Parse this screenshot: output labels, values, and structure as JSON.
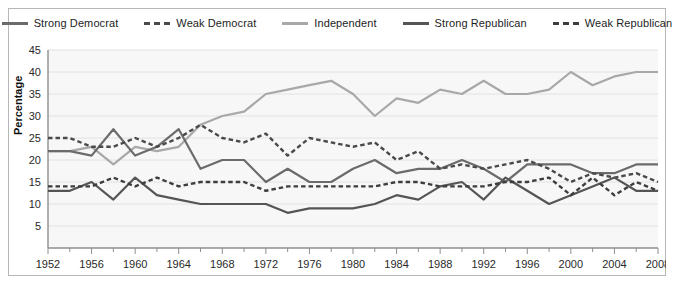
{
  "chart_data": {
    "type": "line",
    "title": "",
    "xlabel": "",
    "ylabel": "Percentage",
    "xlim": [
      1952,
      2008
    ],
    "ylim": [
      0,
      45
    ],
    "ytick_step": 5,
    "yticks": [
      5,
      10,
      15,
      20,
      25,
      30,
      35,
      40,
      45
    ],
    "xticks": [
      1952,
      1956,
      1960,
      1964,
      1968,
      1972,
      1976,
      1980,
      1984,
      1988,
      1992,
      1996,
      2000,
      2004,
      2008
    ],
    "x_minor_step": 2,
    "grid": "horizontal",
    "legend_position": "top-center",
    "x": [
      1952,
      1954,
      1956,
      1958,
      1960,
      1962,
      1964,
      1966,
      1968,
      1970,
      1972,
      1974,
      1976,
      1978,
      1980,
      1982,
      1984,
      1986,
      1988,
      1990,
      1992,
      1994,
      1996,
      1998,
      2000,
      2002,
      2004,
      2006,
      2008
    ],
    "series": [
      {
        "name": "Strong Democrat",
        "style": "solid",
        "color": "#6b6b6b",
        "values": [
          22,
          22,
          21,
          27,
          21,
          23,
          27,
          18,
          20,
          20,
          15,
          18,
          15,
          15,
          18,
          20,
          17,
          18,
          18,
          20,
          18,
          15,
          19,
          19,
          19,
          17,
          17,
          19,
          19
        ]
      },
      {
        "name": "Weak Democrat",
        "style": "dashed",
        "color": "#4a4a4a",
        "values": [
          25,
          25,
          23,
          23,
          25,
          23,
          25,
          28,
          25,
          24,
          26,
          21,
          25,
          24,
          23,
          24,
          20,
          22,
          18,
          19,
          18,
          19,
          20,
          18,
          15,
          17,
          16,
          17,
          15
        ]
      },
      {
        "name": "Independent",
        "style": "solid",
        "color": "#a8a8a8",
        "values": [
          22,
          22,
          23,
          19,
          23,
          22,
          23,
          28,
          30,
          31,
          35,
          36,
          37,
          38,
          35,
          30,
          34,
          33,
          36,
          35,
          38,
          35,
          35,
          36,
          40,
          37,
          39,
          40,
          40
        ]
      },
      {
        "name": "Strong Republican",
        "style": "solid",
        "color": "#555555",
        "values": [
          13,
          13,
          15,
          11,
          16,
          12,
          11,
          10,
          10,
          10,
          10,
          8,
          9,
          9,
          9,
          10,
          12,
          11,
          14,
          15,
          11,
          16,
          13,
          10,
          12,
          14,
          16,
          13,
          13
        ]
      },
      {
        "name": "Weak Republican",
        "style": "dashed",
        "color": "#3d3d3d",
        "values": [
          14,
          14,
          14,
          16,
          14,
          16,
          14,
          15,
          15,
          15,
          13,
          14,
          14,
          14,
          14,
          14,
          15,
          15,
          14,
          14,
          14,
          15,
          15,
          16,
          12,
          16,
          12,
          15,
          13
        ]
      }
    ]
  },
  "legend": {
    "items": [
      {
        "label": "Strong Democrat",
        "style": "solid",
        "color": "#6b6b6b"
      },
      {
        "label": "Weak Democrat",
        "style": "dashed",
        "color": "#4a4a4a"
      },
      {
        "label": "Independent",
        "style": "solid",
        "color": "#a8a8a8"
      },
      {
        "label": "Strong Republican",
        "style": "solid",
        "color": "#555555"
      },
      {
        "label": "Weak Republican",
        "style": "dashed",
        "color": "#3d3d3d"
      }
    ]
  },
  "style": {
    "plot_background": "#f7f7f7",
    "grid_color": "#e2e2e2",
    "axis_color": "#8f8f8f",
    "frame_color": "#b7b7b7",
    "text_color": "#2a2a2a"
  }
}
